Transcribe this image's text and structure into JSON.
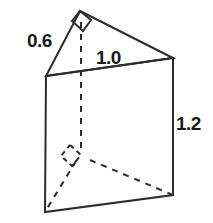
{
  "figure": {
    "name": "triangular-prism",
    "background_color": "#ffffff",
    "line_color": "#2b2b2b",
    "label_color": "#1a1a1a"
  },
  "labels": {
    "slant_edge": "0.6",
    "top_edge": "1.0",
    "vertical_edge": "1.2"
  },
  "geometry": {
    "apex": "80,11",
    "top_right": "173,58",
    "top_left": "46,76",
    "bottom_right": "173,195",
    "bottom_left": "45,212",
    "hidden_back": "81,155",
    "top_face": "80,11 173,58 46,76",
    "front_face": "46,76 173,58 173,195 45,212",
    "right_angle_apex": "72,21 80,11 91,20 83,31 72,21",
    "right_angle_back": "70,145 81,155 72,166 61,156 70,145"
  }
}
